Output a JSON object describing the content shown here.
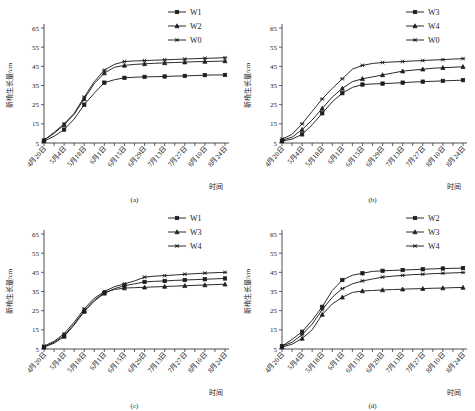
{
  "figure": {
    "width": 475,
    "height": 411,
    "y_axis_label": "新梢生长量/cm",
    "x_axis_label": "时间",
    "captions": [
      "(a)",
      "(b)",
      "(c)",
      "(d)"
    ]
  },
  "chart_data": [
    {
      "type": "line",
      "panel": "(a)",
      "title": "",
      "xlabel": "时间",
      "ylabel": "新梢生长量/cm",
      "ylim": [
        5,
        65
      ],
      "yticks": [
        5,
        15,
        25,
        35,
        45,
        55,
        65
      ],
      "grid": false,
      "legend_position": "top-right",
      "x": [
        "4月20日",
        "4月27日",
        "5月4日",
        "5月11日",
        "5月18日",
        "5月25日",
        "6月1日",
        "6月8日",
        "6月15日",
        "6月22日",
        "6月29日",
        "7月6日",
        "7月13日",
        "7月20日",
        "7月27日",
        "8月3日",
        "8月10日",
        "8月17日",
        "8月24日"
      ],
      "tick_labels": [
        "4月20日",
        "5月4日",
        "5月18日",
        "6月1日",
        "6月15日",
        "6月29日",
        "7月13日",
        "7月27日",
        "8月10日",
        "8月24日"
      ],
      "series": [
        {
          "name": "W1",
          "marker": "square",
          "values": [
            6.0,
            8.5,
            12.0,
            17.5,
            25.0,
            31.0,
            36.5,
            38.0,
            39.0,
            39.3,
            39.5,
            39.6,
            39.7,
            39.9,
            40.0,
            40.2,
            40.4,
            40.5,
            40.5
          ]
        },
        {
          "name": "W2",
          "marker": "triangle",
          "values": [
            6.5,
            10.0,
            14.5,
            20.0,
            28.0,
            36.0,
            41.5,
            44.5,
            45.5,
            46.0,
            46.3,
            46.6,
            46.8,
            47.0,
            47.2,
            47.4,
            47.5,
            47.6,
            47.8
          ]
        },
        {
          "name": "W0",
          "marker": "asterisk",
          "values": [
            6.5,
            10.5,
            15.0,
            20.5,
            29.0,
            37.0,
            43.0,
            46.0,
            47.5,
            47.8,
            48.0,
            48.2,
            48.4,
            48.6,
            48.8,
            49.0,
            49.2,
            49.3,
            49.5
          ]
        }
      ]
    },
    {
      "type": "line",
      "panel": "(b)",
      "title": "",
      "xlabel": "时间",
      "ylabel": "新梢生长量/cm",
      "ylim": [
        5,
        65
      ],
      "yticks": [
        5,
        15,
        25,
        35,
        45,
        55,
        65
      ],
      "grid": false,
      "legend_position": "top-right",
      "x": [
        "4月20日",
        "4月27日",
        "5月4日",
        "5月11日",
        "5月18日",
        "5月25日",
        "6月1日",
        "6月8日",
        "6月15日",
        "6月22日",
        "6月29日",
        "7月6日",
        "7月13日",
        "7月20日",
        "7月27日",
        "8月3日",
        "8月10日",
        "8月17日",
        "8月24日"
      ],
      "tick_labels": [
        "4月20日",
        "5月4日",
        "5月18日",
        "6月1日",
        "6月15日",
        "6月29日",
        "7月13日",
        "7月27日",
        "8月10日",
        "8月24日"
      ],
      "series": [
        {
          "name": "W3",
          "marker": "square",
          "values": [
            6.0,
            7.0,
            9.5,
            14.5,
            20.5,
            26.5,
            31.0,
            34.0,
            35.5,
            35.8,
            36.0,
            36.2,
            36.5,
            36.8,
            37.0,
            37.2,
            37.4,
            37.6,
            37.8
          ]
        },
        {
          "name": "W4",
          "marker": "triangle",
          "values": [
            6.5,
            8.0,
            12.0,
            17.0,
            23.0,
            29.0,
            33.5,
            37.0,
            38.5,
            39.5,
            40.5,
            41.5,
            42.5,
            43.0,
            43.5,
            44.0,
            44.3,
            44.5,
            44.8
          ]
        },
        {
          "name": "W0",
          "marker": "asterisk",
          "values": [
            7.0,
            9.5,
            15.0,
            21.5,
            28.0,
            33.5,
            38.5,
            43.5,
            45.5,
            46.5,
            47.0,
            47.3,
            47.5,
            47.8,
            48.0,
            48.3,
            48.5,
            48.8,
            49.0
          ]
        }
      ]
    },
    {
      "type": "line",
      "panel": "(c)",
      "title": "",
      "xlabel": "时间",
      "ylabel": "新梢生长量/cm",
      "ylim": [
        5,
        65
      ],
      "yticks": [
        5,
        15,
        25,
        35,
        45,
        55,
        65
      ],
      "grid": false,
      "legend_position": "top-right",
      "x": [
        "4月20日",
        "4月27日",
        "5月4日",
        "5月11日",
        "5月18日",
        "5月25日",
        "6月1日",
        "6月8日",
        "6月15日",
        "6月22日",
        "6月29日",
        "7月6日",
        "7月13日",
        "7月20日",
        "7月27日",
        "8月3日",
        "8月10日",
        "8月17日",
        "8月24日"
      ],
      "tick_labels": [
        "4月20日",
        "5月4日",
        "5月18日",
        "6月1日",
        "6月15日",
        "6月29日",
        "7月13日",
        "7月27日",
        "8月10日",
        "8月24日"
      ],
      "series": [
        {
          "name": "W1",
          "marker": "square",
          "values": [
            6.0,
            8.0,
            11.5,
            17.5,
            24.5,
            30.0,
            34.0,
            36.5,
            38.0,
            39.0,
            40.0,
            40.3,
            40.5,
            40.8,
            41.0,
            41.2,
            41.4,
            41.6,
            41.8
          ]
        },
        {
          "name": "W3",
          "marker": "triangle",
          "values": [
            6.0,
            8.5,
            12.0,
            18.0,
            25.0,
            30.5,
            34.5,
            36.0,
            36.8,
            37.0,
            37.2,
            37.4,
            37.6,
            37.8,
            38.0,
            38.2,
            38.4,
            38.6,
            38.8
          ]
        },
        {
          "name": "W4",
          "marker": "asterisk",
          "values": [
            6.5,
            9.0,
            13.0,
            19.0,
            26.0,
            31.5,
            35.0,
            37.5,
            39.0,
            40.5,
            42.5,
            43.0,
            43.3,
            43.6,
            44.0,
            44.3,
            44.6,
            44.8,
            45.0
          ]
        }
      ]
    },
    {
      "type": "line",
      "panel": "(d)",
      "title": "",
      "xlabel": "时间",
      "ylabel": "新梢生长量/cm",
      "ylim": [
        5,
        65
      ],
      "yticks": [
        5,
        15,
        25,
        35,
        45,
        55,
        65
      ],
      "grid": false,
      "legend_position": "top-right",
      "x": [
        "4月20日",
        "4月27日",
        "5月4日",
        "5月11日",
        "5月18日",
        "5月25日",
        "6月1日",
        "6月8日",
        "6月15日",
        "6月22日",
        "6月29日",
        "7月6日",
        "7月13日",
        "7月20日",
        "7月27日",
        "8月3日",
        "8月10日",
        "8月17日",
        "8月24日"
      ],
      "tick_labels": [
        "4月20日",
        "5月4日",
        "5月18日",
        "6月1日",
        "6月15日",
        "6月29日",
        "7月13日",
        "7月27日",
        "8月10日",
        "8月24日"
      ],
      "series": [
        {
          "name": "W2",
          "marker": "square",
          "values": [
            6.5,
            10.0,
            14.0,
            20.0,
            27.0,
            35.5,
            41.0,
            43.5,
            44.5,
            45.5,
            45.8,
            46.0,
            46.2,
            46.4,
            46.6,
            46.8,
            47.0,
            47.1,
            47.2
          ]
        },
        {
          "name": "W3",
          "marker": "triangle",
          "values": [
            6.0,
            7.5,
            10.5,
            15.0,
            23.0,
            28.5,
            32.0,
            34.5,
            35.3,
            35.5,
            35.8,
            36.0,
            36.2,
            36.4,
            36.5,
            36.7,
            36.8,
            37.0,
            37.1
          ]
        },
        {
          "name": "W4",
          "marker": "asterisk",
          "values": [
            6.5,
            8.5,
            12.5,
            18.0,
            25.5,
            32.0,
            36.5,
            39.0,
            40.5,
            41.5,
            42.5,
            43.0,
            43.4,
            43.8,
            44.0,
            44.3,
            44.5,
            44.7,
            44.9
          ]
        }
      ]
    }
  ]
}
